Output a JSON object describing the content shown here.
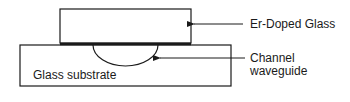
{
  "diagram": {
    "labels": {
      "er_doped_glass": "Er-Doped Glass",
      "channel_line1": "Channel",
      "channel_line2": "waveguide",
      "substrate": "Glass substrate"
    },
    "colors": {
      "stroke": "#1a1a1a",
      "background": "#ffffff"
    }
  }
}
